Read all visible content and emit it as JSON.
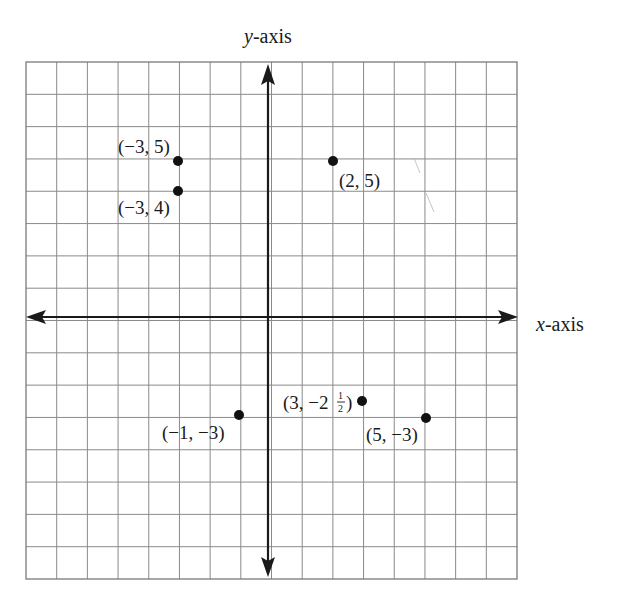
{
  "chart_data": {
    "type": "scatter",
    "title": "",
    "xlabel": "x-axis",
    "ylabel": "y-axis",
    "xlim": [
      -8,
      8
    ],
    "ylim": [
      -8,
      8
    ],
    "grid": true,
    "legend": null,
    "points": [
      {
        "x": -3,
        "y": 5,
        "label": "(−3, 5)"
      },
      {
        "x": -3,
        "y": 4,
        "label": "(−3, 4)"
      },
      {
        "x": 2,
        "y": 5,
        "label": "(2, 5)"
      },
      {
        "x": -1,
        "y": -3,
        "label": "(−1, −3)"
      },
      {
        "x": 3,
        "y": -2.5,
        "label": "(3, −2½)"
      },
      {
        "x": 5,
        "y": -3,
        "label": "(5, −3)"
      }
    ]
  },
  "labels": {
    "x_axis": "x-axis",
    "y_axis": "y-axis",
    "x_axis_var": "x",
    "y_axis_var": "y",
    "axis_suffix": "-axis",
    "p1": "(−3, 5)",
    "p2": "(−3, 4)",
    "p3": "(2, 5)",
    "p4": "(−1, −3)",
    "p5_main": "(3, −2",
    "p5_num": "1",
    "p5_den": "2",
    "p5_close": ")",
    "p6": "(5, −3)"
  },
  "colors": {
    "grid": "#8a8a8a",
    "axis": "#1a1a1a",
    "point": "#111111",
    "background": "#ffffff"
  }
}
